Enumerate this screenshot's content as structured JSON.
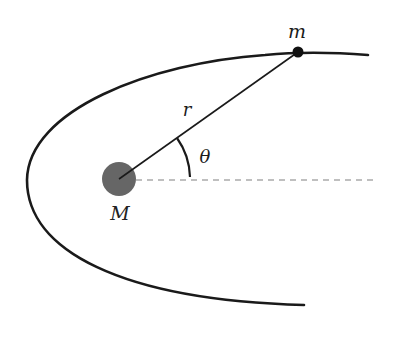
{
  "diagram": {
    "title": "",
    "labels": {
      "small_mass": "m",
      "large_mass": "M",
      "radius": "r",
      "angle": "θ"
    },
    "colors": {
      "orbit": "#1a1a1a",
      "central_body": "#666666",
      "orbiting_body": "#111111",
      "radius_line": "#1a1a1a",
      "reference_axis": "#aaaaaa"
    }
  }
}
